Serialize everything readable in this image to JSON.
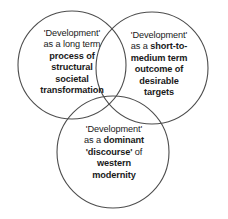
{
  "diagram": {
    "type": "venn",
    "background_color": "#ffffff",
    "stroke_color": "#4d4d4d",
    "text_color": "#1a1a1a",
    "circles": [
      {
        "id": "left",
        "cx": 72,
        "cy": 65,
        "r": 54
      },
      {
        "id": "right",
        "cx": 152,
        "cy": 68,
        "r": 56
      },
      {
        "id": "bottom",
        "cx": 113,
        "cy": 152,
        "r": 56
      }
    ],
    "labels": {
      "left": {
        "lines": [
          {
            "text": "'Development'",
            "bold": false
          },
          {
            "text": "as a long term",
            "bold": false
          },
          {
            "text": "process of",
            "bold": true
          },
          {
            "text": "structural",
            "bold": true
          },
          {
            "text": "societal",
            "bold": true
          },
          {
            "text": "transformation",
            "bold": true
          }
        ],
        "plain": "'Development' as a long term process of structural societal transformation"
      },
      "right": {
        "lines": [
          {
            "text": "'Development'",
            "bold": false
          },
          {
            "text": "as a ",
            "bold": false,
            "bold_tail": "short-to-"
          },
          {
            "text": "medium term",
            "bold": true
          },
          {
            "text": "outcome of",
            "bold": true
          },
          {
            "text": "desirable",
            "bold": true
          },
          {
            "text": "targets",
            "bold": true
          }
        ],
        "plain": "'Development' as a short-to-medium term outcome of desirable targets"
      },
      "bottom": {
        "lines": [
          {
            "text": "'Development'",
            "bold": false
          },
          {
            "text": "as a ",
            "bold": false,
            "bold_tail": "dominant"
          },
          {
            "text": "'discourse' ",
            "bold": true,
            "plain_tail": "of"
          },
          {
            "text": "western",
            "bold": true
          },
          {
            "text": "modernity",
            "bold": true
          }
        ],
        "plain": "'Development' as a dominant 'discourse' of western modernity"
      }
    }
  }
}
